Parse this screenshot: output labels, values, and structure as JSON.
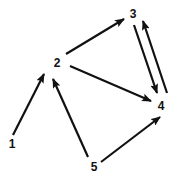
{
  "diagram": {
    "type": "directed-graph",
    "nodes": [
      {
        "id": "1",
        "label": "1",
        "x": 12,
        "y": 148
      },
      {
        "id": "2",
        "label": "2",
        "x": 57,
        "y": 67
      },
      {
        "id": "3",
        "label": "3",
        "x": 133,
        "y": 18
      },
      {
        "id": "4",
        "label": "4",
        "x": 161,
        "y": 110
      },
      {
        "id": "5",
        "label": "5",
        "x": 94,
        "y": 171
      }
    ],
    "edges": [
      {
        "from": "1",
        "to": "2",
        "x1": 13,
        "y1": 135,
        "x2": 44,
        "y2": 74
      },
      {
        "from": "5",
        "to": "2",
        "x1": 88,
        "y1": 157,
        "x2": 53,
        "y2": 79
      },
      {
        "from": "2",
        "to": "3",
        "x1": 66,
        "y1": 54,
        "x2": 124,
        "y2": 19
      },
      {
        "from": "2",
        "to": "4",
        "x1": 70,
        "y1": 66,
        "x2": 151,
        "y2": 101
      },
      {
        "from": "3",
        "to": "4",
        "x1": 134,
        "y1": 25,
        "x2": 157,
        "y2": 93
      },
      {
        "from": "4",
        "to": "3",
        "x1": 167,
        "y1": 93,
        "x2": 143,
        "y2": 21
      },
      {
        "from": "5",
        "to": "4",
        "x1": 101,
        "y1": 162,
        "x2": 160,
        "y2": 117
      }
    ]
  }
}
